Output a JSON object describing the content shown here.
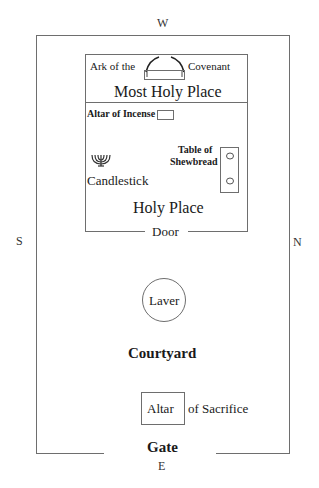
{
  "compass": {
    "west": "W",
    "east": "E",
    "south": "S",
    "north": "N"
  },
  "most_holy_place": {
    "title": "Most Holy Place",
    "ark_label_left": "Ark of the",
    "ark_label_right": "Covenant"
  },
  "holy_place": {
    "title": "Holy Place",
    "altar_of_incense": "Altar of Incense",
    "table_label_line1": "Table of",
    "table_label_line2": "Shewbread",
    "candlestick": "Candlestick",
    "door": "Door"
  },
  "courtyard": {
    "title": "Courtyard",
    "laver": "Laver",
    "altar": "Altar",
    "altar_suffix": "of Sacrifice",
    "gate": "Gate"
  },
  "colors": {
    "lines": "#6e6e6e",
    "text": "#1a1a1a",
    "background": "#ffffff"
  }
}
